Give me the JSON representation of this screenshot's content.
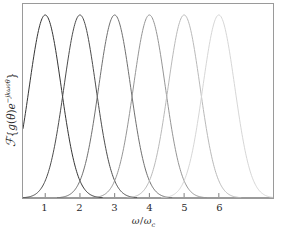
{
  "chart_data": {
    "type": "line",
    "title": "",
    "subtitle": "",
    "xlabel": "ω/ωc",
    "xlabel_parts": {
      "omega_numerator": "ω",
      "slash": "/",
      "omega_denominator": "ω",
      "denominator_subscript": "c"
    },
    "ylabel": "ℱ{g(θ)e−jkω0θ}",
    "ylabel_parts": {
      "operator": "ℱ",
      "brace_open": "{",
      "function": "g",
      "arg_open": "(",
      "arg": "θ",
      "arg_close": ")",
      "base": "e",
      "exponent": "−jkω",
      "exponent_subscript": "0",
      "exponent_tail": "θ",
      "brace_close": "}"
    },
    "xtick_labels": [
      "1",
      "2",
      "3",
      "4",
      "5",
      "6"
    ],
    "xtick_values": [
      1,
      2,
      3,
      4,
      5,
      6
    ],
    "ytick_labels": [],
    "xlim": [
      0.36,
      7.56
    ],
    "ylim": [
      0,
      1.06
    ],
    "grid": false,
    "legend_position": "none",
    "annotations": [],
    "frame": {
      "left_px": 22,
      "top_px": 3,
      "width_px": 252,
      "height_px": 196,
      "border_color": "#9a9a9a"
    },
    "peak_spacing_px": 35,
    "first_peak_px": 72,
    "curve_shape": "gaussian",
    "curve_sigma_units": 0.46,
    "series": [
      {
        "name": "k = 1",
        "peak_x": 1,
        "peak_y": 1.0,
        "color": "#333333",
        "line_width": 1.0
      },
      {
        "name": "k = 2",
        "peak_x": 2,
        "peak_y": 1.0,
        "color": "#4a4a4a",
        "line_width": 1.0
      },
      {
        "name": "k = 3",
        "peak_x": 3,
        "peak_y": 1.0,
        "color": "#6e6e6e",
        "line_width": 1.0
      },
      {
        "name": "k = 4",
        "peak_x": 4,
        "peak_y": 1.0,
        "color": "#949494",
        "line_width": 1.0
      },
      {
        "name": "k = 5",
        "peak_x": 5,
        "peak_y": 1.0,
        "color": "#b8b8b8",
        "line_width": 1.0
      },
      {
        "name": "k = 6",
        "peak_x": 6,
        "peak_y": 1.0,
        "color": "#d6d6d6",
        "line_width": 1.0
      }
    ]
  }
}
